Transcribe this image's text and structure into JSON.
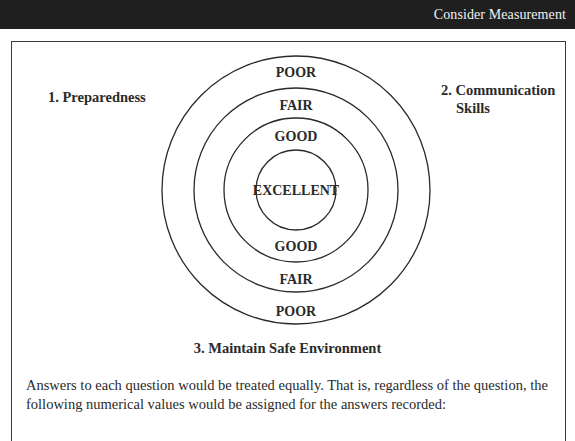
{
  "header": {
    "title": "Consider Measurement"
  },
  "diagram": {
    "center": {
      "x": 296,
      "y": 190
    },
    "rings": [
      {
        "radius": 134,
        "name": "poor"
      },
      {
        "radius": 102,
        "name": "fair"
      },
      {
        "radius": 72,
        "name": "good"
      },
      {
        "radius": 40,
        "name": "excellent"
      }
    ],
    "labels": {
      "top_poor": "POOR",
      "top_fair": "FAIR",
      "top_good": "GOOD",
      "center_excellent": "EXCELLENT",
      "bottom_good": "GOOD",
      "bottom_fair": "FAIR",
      "bottom_poor": "POOR"
    },
    "categories": {
      "one": "1. Preparedness",
      "two_line1": "2. Communication",
      "two_line2": "Skills",
      "three": "3. Maintain Safe Environment"
    }
  },
  "body": {
    "paragraph": "Answers to each question would be treated equally. That is, regardless of the question, the following numerical values would be assigned for the answers recorded:"
  }
}
